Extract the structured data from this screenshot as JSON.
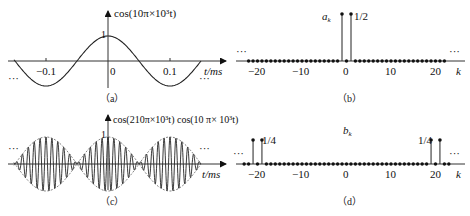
{
  "figure": {
    "panels": [
      {
        "id": "a",
        "caption": "（a）",
        "function_label": "cos(10π×10³t)",
        "x_axis_label": "t/ms",
        "peak_label": "1",
        "origin_label": "0",
        "x_ticks": [
          "−0.1",
          "0.1"
        ],
        "ellipsis_left": "···",
        "ellipsis_right": "···"
      },
      {
        "id": "b",
        "caption": "（b）",
        "coef_label": "a",
        "coef_sub": "k",
        "stem_value_label": "1/2",
        "x_axis_label": "k",
        "x_ticks": [
          "−20",
          "−10",
          "0",
          "10",
          "20"
        ],
        "ellipsis_left": "···",
        "ellipsis_right": "···"
      },
      {
        "id": "c",
        "caption": "（c）",
        "function_label": "cos(210π×10³t) cos(10 π× 10³t)",
        "x_axis_label": "t/ms",
        "peak_label": "1",
        "ellipsis_left": "···",
        "ellipsis_right": "···"
      },
      {
        "id": "d",
        "caption": "（d）",
        "coef_label": "b",
        "coef_sub": "k",
        "stem_value_label_left": "1/4",
        "stem_value_label_right": "1/4",
        "x_axis_label": "k",
        "x_ticks": [
          "−20",
          "−10",
          "0",
          "10",
          "20"
        ],
        "ellipsis_left": "···",
        "ellipsis_right": "···"
      }
    ]
  },
  "chart_data": [
    {
      "type": "line",
      "title": "cos(10π×10³t)",
      "xlabel": "t/ms",
      "ylabel": "",
      "x_ticks": [
        -0.1,
        0,
        0.1
      ],
      "x_range_ms": [
        -0.15,
        0.15
      ],
      "ylim": [
        -1,
        1
      ],
      "annotations": [
        "1 (peak at t=0)",
        "··· periodic continuation"
      ],
      "series": [
        {
          "name": "cos(10π×10³t)",
          "frequency_kHz": 5,
          "period_ms": 0.2,
          "amplitude": 1
        }
      ]
    },
    {
      "type": "stem",
      "title": "a_k",
      "xlabel": "k",
      "x_ticks": [
        -20,
        -10,
        0,
        10,
        20
      ],
      "k_range": [
        -22,
        22
      ],
      "values": {
        "k": [
          -1,
          1
        ],
        "a_k": [
          0.5,
          0.5
        ]
      },
      "other_values": "a_k = 0 for all other k",
      "annotations": [
        "1/2"
      ]
    },
    {
      "type": "line",
      "title": "cos(210π×10³t) cos(10 π× 10³t)",
      "xlabel": "t/ms",
      "ylim": [
        -1,
        1
      ],
      "annotations": [
        "1 (peak)",
        "··· periodic continuation"
      ],
      "series": [
        {
          "name": "carrier cos(210π×10³t)",
          "frequency_kHz": 105
        },
        {
          "name": "envelope cos(10π×10³t)",
          "frequency_kHz": 5
        }
      ]
    },
    {
      "type": "stem",
      "title": "b_k",
      "xlabel": "k",
      "x_ticks": [
        -20,
        -10,
        0,
        10,
        20
      ],
      "k_range": [
        -23,
        23
      ],
      "values": {
        "k": [
          -21,
          -19,
          19,
          21
        ],
        "b_k": [
          0.25,
          0.25,
          0.25,
          0.25
        ]
      },
      "other_values": "b_k = 0 for all other k",
      "annotations": [
        "1/4",
        "1/4"
      ]
    }
  ]
}
